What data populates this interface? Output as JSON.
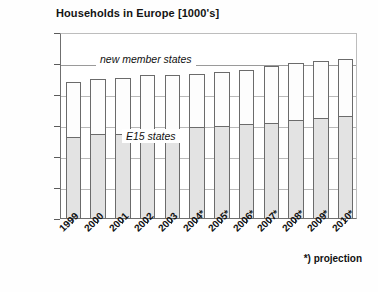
{
  "chart_data": {
    "type": "bar",
    "subtype": "stacked-vertical",
    "title": "Households in Europe [1000's]",
    "xlabel": "",
    "ylabel": "",
    "ylim": [
      100000,
      220000
    ],
    "ytick_step": 20000,
    "yticks": [
      100000,
      120000,
      140000,
      160000,
      180000,
      200000,
      220000
    ],
    "ytick_labels": [
      "100000",
      "120000",
      "140000",
      "160000",
      "180000",
      "200000",
      "220000"
    ],
    "grid": true,
    "grid_axis": "y",
    "legend": "in-plot annotations",
    "categories": [
      "1999",
      "2000",
      "2001",
      "2002",
      "2003",
      "2004*",
      "2005*",
      "2006*",
      "2007*",
      "2008*",
      "2009*",
      "2010*"
    ],
    "series": [
      {
        "name": "E15 states",
        "color": "#e3e3e3",
        "values": [
          152000,
          154000,
          154500,
          156500,
          157500,
          158500,
          159500,
          160500,
          161500,
          163500,
          164500,
          166000
        ]
      },
      {
        "name": "new member states",
        "color": "#fdfdfd",
        "values": [
          35500,
          36000,
          36000,
          35500,
          35000,
          34500,
          34500,
          35000,
          36500,
          36500,
          36500,
          36500
        ]
      }
    ],
    "totals": [
      187500,
      190000,
      190500,
      192000,
      192500,
      193000,
      194000,
      195500,
      198000,
      200000,
      201000,
      202500
    ],
    "annotations": [
      {
        "text": "new member states",
        "style": "italic",
        "region": "upper-segment"
      },
      {
        "text": "E15 states",
        "style": "italic",
        "region": "lower-segment"
      }
    ],
    "footnote": "*) projection"
  },
  "chart": {
    "title": "Households in Europe [1000's]",
    "footnote": "*) projection",
    "caption": "",
    "label_new_member_states": "new member states",
    "label_e15_states": "E15 states"
  }
}
